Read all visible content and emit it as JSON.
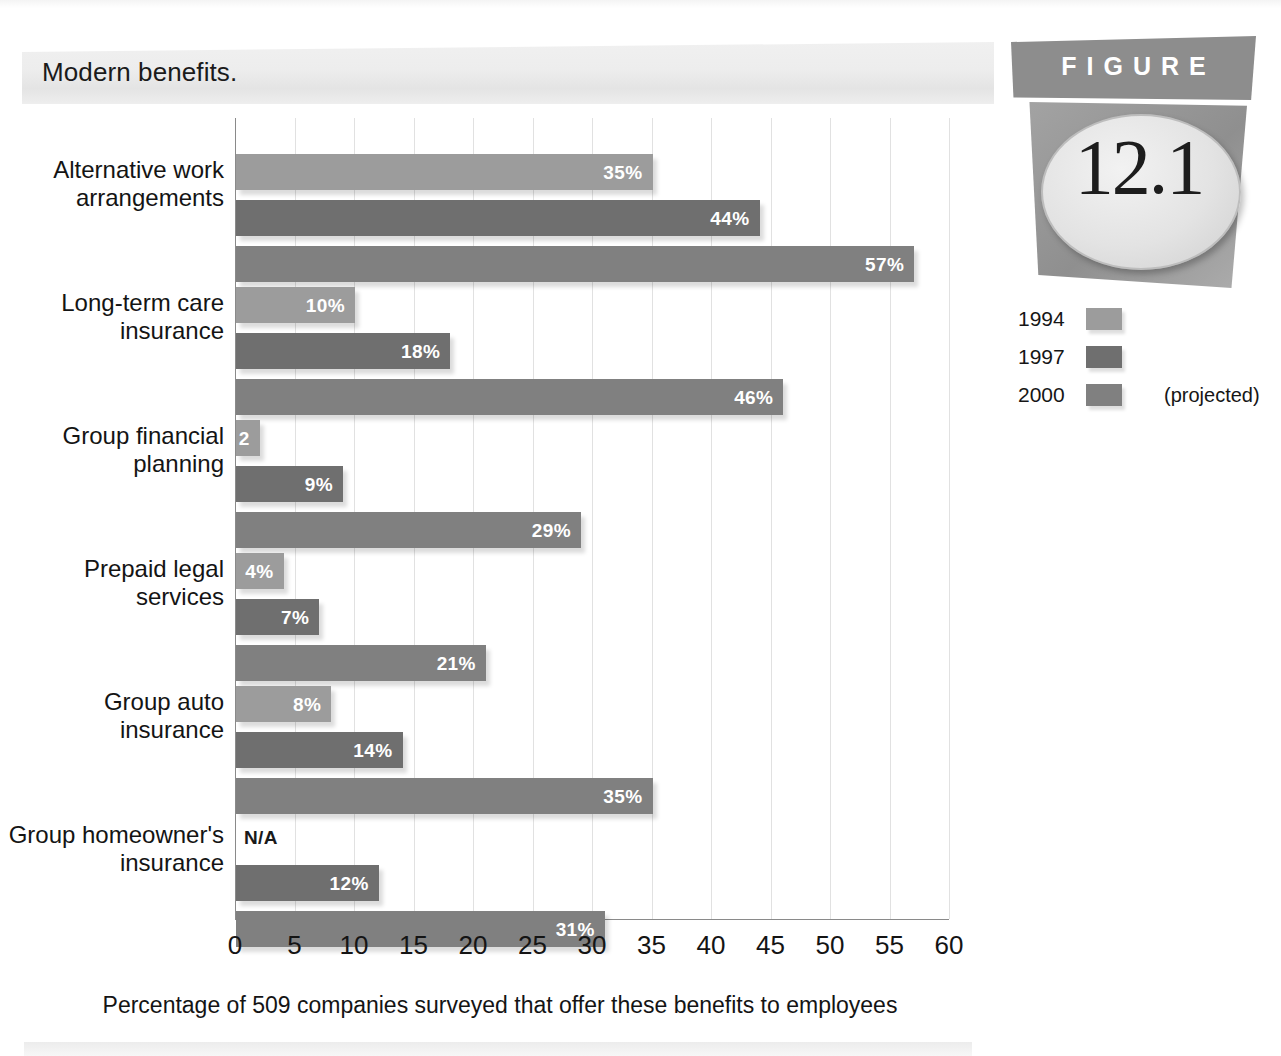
{
  "title": "Modern benefits.",
  "figure_badge": {
    "word": "FIGURE",
    "number": "12.1"
  },
  "legend": {
    "items": [
      {
        "year": "1994",
        "color": "#9c9c9c",
        "note": ""
      },
      {
        "year": "1997",
        "color": "#6f6f6f",
        "note": ""
      },
      {
        "year": "2000",
        "color": "#808080",
        "note": "(projected)"
      }
    ]
  },
  "chart_data": {
    "type": "bar",
    "orientation": "horizontal",
    "title": "Modern benefits.",
    "xlabel": "Percentage of 509 companies surveyed that offer these benefits to employees",
    "ylabel": "",
    "xlim": [
      0,
      60
    ],
    "xticks": [
      "0",
      "5",
      "10",
      "15",
      "20",
      "25",
      "30",
      "35",
      "40",
      "45",
      "50",
      "55",
      "60"
    ],
    "grid": true,
    "legend_position": "right",
    "categories": [
      "Alternative work\narrangements",
      "Long-term care\ninsurance",
      "Group financial\nplanning",
      "Prepaid legal\nservices",
      "Group auto\ninsurance",
      "Group homeowner's\ninsurance"
    ],
    "series": [
      {
        "name": "1994",
        "color": "#9c9c9c",
        "values": [
          35,
          10,
          2,
          4,
          8,
          null
        ],
        "labels": [
          "35%",
          "10%",
          "2",
          "4%",
          "8%",
          "N/A"
        ]
      },
      {
        "name": "1997",
        "color": "#6f6f6f",
        "values": [
          44,
          18,
          9,
          7,
          14,
          12
        ],
        "labels": [
          "44%",
          "18%",
          "9%",
          "7%",
          "14%",
          "12%"
        ]
      },
      {
        "name": "2000",
        "color": "#808080",
        "values": [
          57,
          46,
          29,
          21,
          35,
          31
        ],
        "labels": [
          "57%",
          "46%",
          "29%",
          "21%",
          "35%",
          "31%"
        ]
      }
    ]
  }
}
